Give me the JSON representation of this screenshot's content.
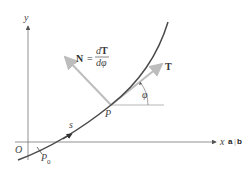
{
  "diagram": {
    "axes": {
      "x_label": "x",
      "y_label": "y",
      "origin_label": "O"
    },
    "points": {
      "start": "P",
      "start_subscript": "0",
      "current": "P"
    },
    "arc_length_label": "s",
    "tangent_label": "T",
    "normal_label": "N",
    "normal_equation": {
      "lhs": "N",
      "equals": "=",
      "numerator_d": "d",
      "numerator_T": "T",
      "denominator": "dφ"
    },
    "angle_label": "φ",
    "panel_labels": {
      "a": "a",
      "b": "b",
      "separator": "|"
    },
    "colors": {
      "curve": "#4a4a4a",
      "axes": "#777777",
      "vectors": "#bdbdbd"
    }
  }
}
